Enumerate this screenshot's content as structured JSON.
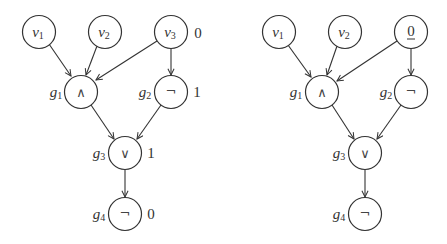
{
  "diagrams": [
    {
      "name": "left-circuit",
      "inputs": [
        {
          "id": "v1",
          "base": "v",
          "sub": "1",
          "value": ""
        },
        {
          "id": "v2",
          "base": "v",
          "sub": "2",
          "value": ""
        },
        {
          "id": "v3",
          "base": "v",
          "sub": "3",
          "value": "0"
        }
      ],
      "gates": [
        {
          "id": "g1",
          "base": "g",
          "sub": "1",
          "op": "∧",
          "value": ""
        },
        {
          "id": "g2",
          "base": "g",
          "sub": "2",
          "op": "¬",
          "value": "1"
        },
        {
          "id": "g3",
          "base": "g",
          "sub": "3",
          "op": "∨",
          "value": "1"
        },
        {
          "id": "g4",
          "base": "g",
          "sub": "4",
          "op": "¬",
          "value": "0"
        }
      ],
      "edges": [
        [
          "v1",
          "g1"
        ],
        [
          "v2",
          "g1"
        ],
        [
          "v3",
          "g1"
        ],
        [
          "v3",
          "g2"
        ],
        [
          "g1",
          "g3"
        ],
        [
          "g2",
          "g3"
        ],
        [
          "g3",
          "g4"
        ]
      ]
    },
    {
      "name": "right-circuit",
      "inputs": [
        {
          "id": "v1",
          "base": "v",
          "sub": "1"
        },
        {
          "id": "v2",
          "base": "v",
          "sub": "2"
        },
        {
          "id": "v3",
          "replaced_by_constant": "0",
          "underlined": true
        }
      ],
      "gates": [
        {
          "id": "g1",
          "base": "g",
          "sub": "1",
          "op": "∧"
        },
        {
          "id": "g2",
          "base": "g",
          "sub": "2",
          "op": "¬"
        },
        {
          "id": "g3",
          "base": "g",
          "sub": "3",
          "op": "∨"
        },
        {
          "id": "g4",
          "base": "g",
          "sub": "4",
          "op": "¬"
        }
      ],
      "edges": [
        [
          "v1",
          "g1"
        ],
        [
          "v2",
          "g1"
        ],
        [
          "v3",
          "g1"
        ],
        [
          "v3",
          "g2"
        ],
        [
          "g1",
          "g3"
        ],
        [
          "g2",
          "g3"
        ],
        [
          "g3",
          "g4"
        ]
      ]
    }
  ]
}
